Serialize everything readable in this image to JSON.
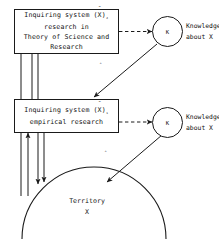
{
  "diagram": {
    "stroke_color": "#1a1a1a",
    "background_color": "#ffffff",
    "nodes": {
      "upper_box": {
        "line1_prefix": "Inquiring system",
        "line1_symbol_base": "(X)",
        "line1_symbol_hat": "ˆ",
        "line1_subscript": "₂",
        "line2": "research in",
        "line3": "Theory of Science and",
        "line4": "Research"
      },
      "lower_box": {
        "line1_prefix": "Inquiring system",
        "line1_symbol_base": "(X)",
        "line1_symbol_hat": "ˆ",
        "line1_subscript": "₁",
        "line2": "empirical research"
      },
      "upper_circle": {
        "label": "K"
      },
      "lower_circle": {
        "label": "K"
      },
      "territory": {
        "line1": "Territory",
        "line2": "X"
      }
    },
    "labels": {
      "upper_knowledge_line1": "Knowledge",
      "upper_knowledge_line2_prefix": "about ",
      "upper_knowledge_line2_symbol": "X",
      "upper_knowledge_line2_hat": "ˆ",
      "lower_knowledge_line1": "Knowledge",
      "lower_knowledge_line2": "about X",
      "upper_diagonal_glyph": "ˆ",
      "lower_diagonal_glyph": "ˆ"
    }
  }
}
